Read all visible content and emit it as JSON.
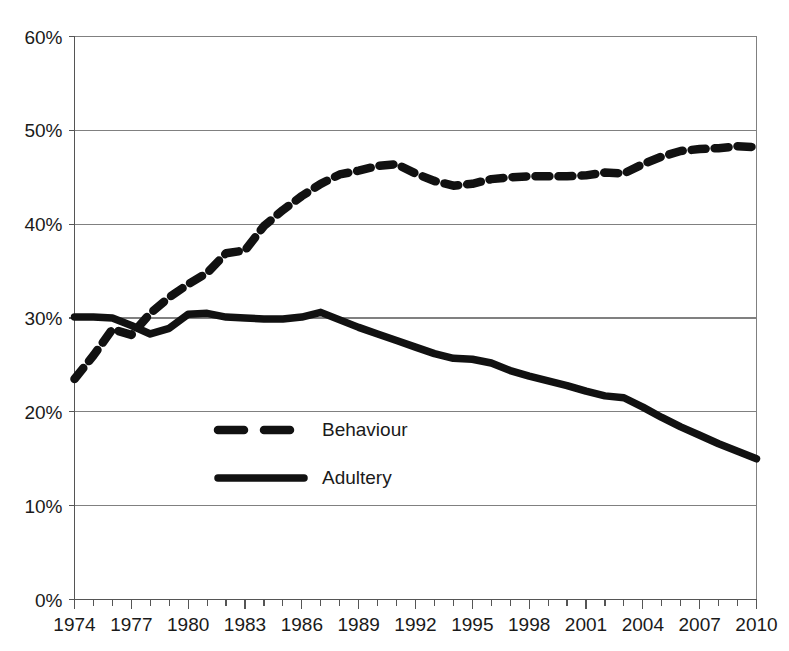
{
  "chart_data": {
    "type": "line",
    "title": "",
    "subtitle": "",
    "xlabel": "",
    "ylabel": "",
    "xlim": [
      1974,
      2010
    ],
    "ylim": [
      0,
      60
    ],
    "grid": true,
    "grid_axis": "y",
    "legend_position": "inside-left-middle",
    "y_tick_labels": [
      "0%",
      "10%",
      "20%",
      "30%",
      "40%",
      "50%",
      "60%"
    ],
    "y_tick_values": [
      0,
      10,
      20,
      30,
      40,
      50,
      60
    ],
    "x_tick_labels": [
      "1974",
      "1977",
      "1980",
      "1983",
      "1986",
      "1989",
      "1992",
      "1995",
      "1998",
      "2001",
      "2004",
      "2007",
      "2010"
    ],
    "x_tick_values": [
      1974,
      1977,
      1980,
      1983,
      1986,
      1989,
      1992,
      1995,
      1998,
      2001,
      2004,
      2007,
      2010
    ],
    "x_minor_ticks_every": 1,
    "x": [
      1974,
      1975,
      1976,
      1977,
      1978,
      1979,
      1980,
      1981,
      1982,
      1983,
      1984,
      1985,
      1986,
      1987,
      1988,
      1989,
      1990,
      1991,
      1992,
      1993,
      1994,
      1995,
      1996,
      1997,
      1998,
      1999,
      2000,
      2001,
      2002,
      2003,
      2004,
      2005,
      2006,
      2007,
      2008,
      2009,
      2010
    ],
    "series": [
      {
        "name": "Behaviour",
        "style": "dashed",
        "color": "#111111",
        "values": [
          23.5,
          26.0,
          28.8,
          28.2,
          30.5,
          32.2,
          33.6,
          34.8,
          36.9,
          37.2,
          39.8,
          41.5,
          43.0,
          44.3,
          45.3,
          45.7,
          46.2,
          46.4,
          45.4,
          44.6,
          44.1,
          44.3,
          44.8,
          45.0,
          45.1,
          45.1,
          45.1,
          45.2,
          45.5,
          45.4,
          46.4,
          47.2,
          47.8,
          48.0,
          48.1,
          48.3,
          48.2
        ]
      },
      {
        "name": "Adultery",
        "style": "solid",
        "color": "#111111",
        "values": [
          30.1,
          30.1,
          30.0,
          29.2,
          28.3,
          28.9,
          30.4,
          30.5,
          30.1,
          30.0,
          29.9,
          29.9,
          30.1,
          30.6,
          29.8,
          29.0,
          28.3,
          27.6,
          26.9,
          26.2,
          25.7,
          25.6,
          25.2,
          24.4,
          23.8,
          23.3,
          22.8,
          22.2,
          21.7,
          21.5,
          20.5,
          19.4,
          18.4,
          17.5,
          16.6,
          15.8,
          15.0
        ]
      }
    ],
    "legend_entries": [
      {
        "label": "Behaviour",
        "style": "dashed"
      },
      {
        "label": "Adultery",
        "style": "solid"
      }
    ]
  },
  "axes": {
    "y_axis_name": "percentage-axis",
    "x_axis_name": "year-axis"
  }
}
